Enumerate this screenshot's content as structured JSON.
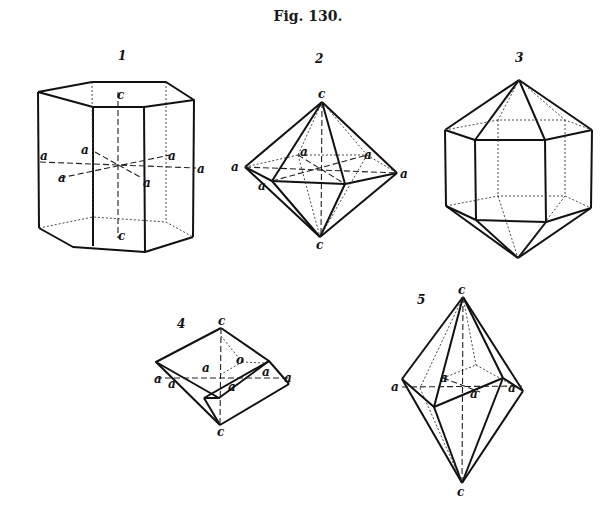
{
  "figure": {
    "title": "Fig. 130.",
    "panels": [
      {
        "number": "1",
        "shape": "hexagonal prism",
        "labels": {
          "c_top": "c",
          "c_bottom": "c",
          "a": [
            "a",
            "a",
            "a",
            "a",
            "a",
            "a"
          ]
        }
      },
      {
        "number": "2",
        "shape": "hexagonal bipyramid",
        "labels": {
          "c_top": "c",
          "c_bottom": "c",
          "a": [
            "a",
            "a",
            "a",
            "a",
            "a"
          ]
        }
      },
      {
        "number": "3",
        "shape": "hexagonal prism with bipyramid terminations",
        "labels": {}
      },
      {
        "number": "4",
        "shape": "rhombohedron",
        "labels": {
          "c_top": "c",
          "c_bottom": "c",
          "o": "o",
          "a": [
            "a",
            "a",
            "a",
            "a",
            "a",
            "a"
          ]
        }
      },
      {
        "number": "5",
        "shape": "scalenohedron",
        "labels": {
          "c_top": "c",
          "c_bottom": "c",
          "a": [
            "a",
            "a",
            "a",
            "a"
          ]
        }
      }
    ]
  }
}
